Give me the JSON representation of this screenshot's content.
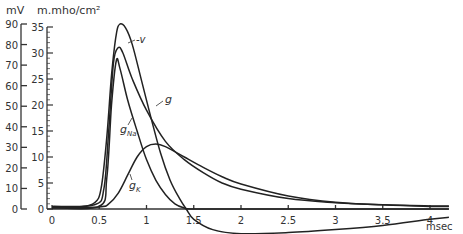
{
  "chart_data": {
    "type": "line",
    "title": "",
    "xlabel": "msec",
    "ylabel_left": "mV",
    "ylabel_right": "m.mho/cm²",
    "xlim": [
      0,
      4.2
    ],
    "ylim_left": [
      0,
      90
    ],
    "ylim_right": [
      0,
      35
    ],
    "x_ticks": [
      "0",
      "0.5",
      "1",
      "1.5",
      "2",
      "2.5",
      "3",
      "3.5",
      "4"
    ],
    "x_tick_values": [
      0,
      0.5,
      1,
      1.5,
      2,
      2.5,
      3,
      3.5,
      4
    ],
    "y_left_ticks": [
      0,
      10,
      20,
      30,
      40,
      50,
      60,
      70,
      80,
      90
    ],
    "y_right_ticks": [
      0,
      5,
      10,
      15,
      20,
      25,
      30,
      35
    ],
    "grid": false,
    "legend": "inline annotations",
    "series": [
      {
        "name": "-V",
        "axis": "left",
        "unit": "mV",
        "x": [
          0,
          0.3,
          0.45,
          0.52,
          0.58,
          0.63,
          0.68,
          0.72,
          0.78,
          0.85,
          0.95,
          1.05,
          1.15,
          1.25,
          1.35,
          1.42,
          1.5,
          1.7,
          2.0,
          2.5,
          3.0,
          3.5,
          4.0,
          4.2
        ],
        "values": [
          0.5,
          1,
          3,
          10,
          35,
          65,
          85,
          90,
          88,
          80,
          62,
          44,
          27,
          14,
          5,
          0,
          -5,
          -10,
          -12,
          -11.5,
          -10,
          -8,
          -5,
          -4
        ]
      },
      {
        "name": "g",
        "axis": "right",
        "unit": "m.mho/cm²",
        "x": [
          0,
          0.45,
          0.55,
          0.6,
          0.65,
          0.7,
          0.75,
          0.85,
          1.0,
          1.2,
          1.4,
          1.6,
          1.8,
          2.0,
          2.5,
          3.0,
          3.5,
          4.0,
          4.2
        ],
        "values": [
          0.5,
          0.8,
          4,
          15,
          28,
          31,
          30,
          25,
          19,
          13,
          9.5,
          7,
          5,
          3.8,
          2,
          1.2,
          0.8,
          0.6,
          0.6
        ]
      },
      {
        "name": "g_Na",
        "axis": "right",
        "unit": "m.mho/cm²",
        "x": [
          0,
          0.5,
          0.58,
          0.63,
          0.68,
          0.72,
          0.8,
          0.9,
          1.0,
          1.1,
          1.2,
          1.3,
          1.4,
          1.5,
          2.0,
          4.2
        ],
        "values": [
          0.3,
          0.5,
          6,
          20,
          28.5,
          27,
          21,
          15,
          9.5,
          5.5,
          2.8,
          1,
          0.2,
          0,
          0,
          0
        ]
      },
      {
        "name": "g_K",
        "axis": "right",
        "unit": "m.mho/cm²",
        "x": [
          0,
          0.5,
          0.6,
          0.7,
          0.8,
          0.9,
          1.0,
          1.1,
          1.2,
          1.4,
          1.6,
          1.8,
          2.0,
          2.5,
          3.0,
          3.5,
          4.0,
          4.2
        ],
        "values": [
          0.3,
          0.4,
          1,
          3,
          6.5,
          10,
          12,
          12.5,
          12,
          10,
          8,
          6.2,
          4.8,
          2.5,
          1.3,
          0.8,
          0.5,
          0.5
        ]
      }
    ],
    "annotations": [
      "-v",
      "g",
      "g_Na",
      "g_K"
    ]
  },
  "labels": {
    "y_left_unit": "mV",
    "y_right_unit": "m.mho/cm²",
    "x_unit": "msec",
    "v": "-v",
    "g": "g",
    "gna_main": "g",
    "gna_sub": "Na",
    "gk_main": "g",
    "gk_sub": "K"
  }
}
